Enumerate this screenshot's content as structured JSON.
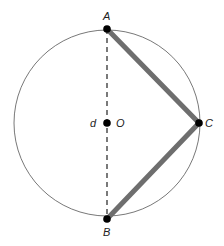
{
  "diagram": {
    "type": "geometry",
    "circle": {
      "center": "O",
      "cx": 107,
      "cy": 123,
      "r": 93,
      "stroke": "#555555"
    },
    "points": {
      "A": {
        "label": "A",
        "x": 107,
        "y": 29
      },
      "B": {
        "label": "B",
        "x": 107,
        "y": 219
      },
      "C": {
        "label": "C",
        "x": 199,
        "y": 123
      },
      "O": {
        "label": "O",
        "x": 107,
        "y": 123
      }
    },
    "diameter_label": "d",
    "segments": [
      {
        "from": "A",
        "to": "B",
        "style": "dashed",
        "color": "#333333"
      },
      {
        "from": "A",
        "to": "C",
        "style": "thick",
        "color": "#6e6e6e"
      },
      {
        "from": "C",
        "to": "B",
        "style": "thick",
        "color": "#6e6e6e"
      }
    ]
  }
}
